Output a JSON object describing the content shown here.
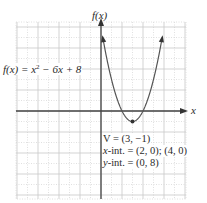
{
  "chart_data": {
    "type": "line",
    "title": "",
    "function": "f(x) = x^2 - 6x + 8",
    "xlabel": "x",
    "ylabel": "f(x)",
    "xlim": [
      -8,
      8
    ],
    "ylim": [
      -8.4,
      8.5
    ],
    "grid": true,
    "series": [
      {
        "name": "f(x) = x² − 6x + 8",
        "x": [
          0.2,
          1,
          2,
          3,
          4,
          5,
          6,
          6.2
        ],
        "y": [
          6.84,
          3,
          0,
          -1,
          0,
          3,
          8,
          9.24
        ]
      }
    ],
    "points": [
      {
        "label": "vertex",
        "x": 3,
        "y": -1
      }
    ],
    "annotations": [
      "V = (3, −1)",
      "x-int. = (2, 0); (4, 0)",
      "y-int. = (0, 8)"
    ]
  },
  "labels": {
    "function_prefix": "f(x) = x",
    "function_exp": "2",
    "function_suffix": " − 6x + 8",
    "y_axis": "f(x)",
    "x_axis": "x",
    "vertex_text": "V = (3, −1)",
    "x_int_prefix": "x",
    "x_int_text": "-int. = (2, 0); (4, 0)",
    "y_int_prefix": "y",
    "y_int_text": "-int. = (0, 8)"
  },
  "colors": {
    "curve": "#555555",
    "axis": "#444444",
    "grid_major": "#c8c8c8",
    "grid_minor": "#d8d8d8"
  }
}
